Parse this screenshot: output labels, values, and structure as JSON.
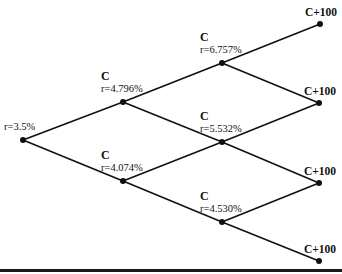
{
  "diagram": {
    "type": "binomial-interest-rate-tree",
    "root": {
      "id": "n0",
      "rate_label": "r=3.5%"
    },
    "nodes": [
      {
        "id": "n0",
        "period": 0,
        "cash_label": "",
        "rate_label": "r=3.5%"
      },
      {
        "id": "n1u",
        "period": 1,
        "cash_label": "C",
        "rate_label": "r=4.796%"
      },
      {
        "id": "n1d",
        "period": 1,
        "cash_label": "C",
        "rate_label": "r=4.074%"
      },
      {
        "id": "n2uu",
        "period": 2,
        "cash_label": "C",
        "rate_label": "r=6.757%"
      },
      {
        "id": "n2ud",
        "period": 2,
        "cash_label": "C",
        "rate_label": "r=5.532%"
      },
      {
        "id": "n2dd",
        "period": 2,
        "cash_label": "C",
        "rate_label": "r=4.530%"
      },
      {
        "id": "n3a",
        "period": 3,
        "cash_label": "C+100",
        "rate_label": ""
      },
      {
        "id": "n3b",
        "period": 3,
        "cash_label": "C+100",
        "rate_label": ""
      },
      {
        "id": "n3c",
        "period": 3,
        "cash_label": "C+100",
        "rate_label": ""
      },
      {
        "id": "n3d",
        "period": 3,
        "cash_label": "C+100",
        "rate_label": ""
      }
    ],
    "edges": [
      [
        "n0",
        "n1u"
      ],
      [
        "n0",
        "n1d"
      ],
      [
        "n1u",
        "n2uu"
      ],
      [
        "n1u",
        "n2ud"
      ],
      [
        "n1d",
        "n2ud"
      ],
      [
        "n1d",
        "n2dd"
      ],
      [
        "n2uu",
        "n3a"
      ],
      [
        "n2uu",
        "n3b"
      ],
      [
        "n2ud",
        "n3b"
      ],
      [
        "n2ud",
        "n3c"
      ],
      [
        "n2dd",
        "n3c"
      ],
      [
        "n2dd",
        "n3d"
      ]
    ]
  }
}
